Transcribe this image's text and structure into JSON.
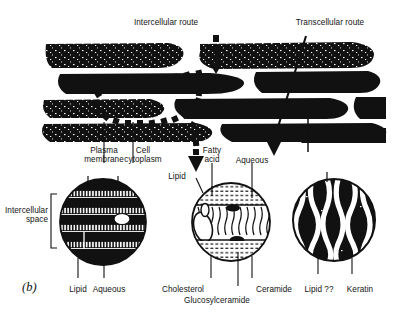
{
  "figure": {
    "panel_id": "(b)"
  },
  "routes": {
    "intercellular": "Intercellular route",
    "transcellular": "Transcellular route"
  },
  "upper_labels": {
    "plasma_membrane": "Plasma\nmembrane",
    "cell_cytoplasm": "Cell\ncytoplasm",
    "fatty_acid": "Fatty\nacid",
    "aqueous": "Aqueous",
    "lipid": "Lipid"
  },
  "side_labels": {
    "intercellular_space": "Intercellular\nspace"
  },
  "lower_labels": {
    "lipid_left": "Lipid",
    "aqueous_left": "Aqueous",
    "cholesterol": "Cholesterol",
    "glucosylceramide": "Glucosylceramide",
    "ceramide": "Ceramide",
    "lipid_right": "Lipid ??",
    "keratin": "Keratin"
  },
  "insets": [
    {
      "name": "lamellar-bilayer-inset",
      "cx": 103,
      "cy": 222,
      "r": 43
    },
    {
      "name": "molecular-lipid-inset",
      "cx": 231,
      "cy": 222,
      "r": 39
    },
    {
      "name": "keratin-filament-inset",
      "cx": 334,
      "cy": 220,
      "r": 41
    }
  ],
  "colors": {
    "ink": "#111111",
    "background": "#ffffff"
  }
}
